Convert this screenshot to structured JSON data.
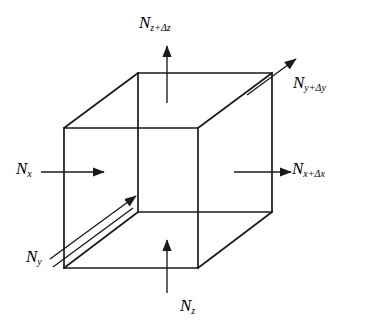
{
  "diagram": {
    "shape": "cube",
    "stroke_color": "#1a1a1a",
    "background_color": "#ffffff",
    "labels": [
      {
        "id": "nz_plus_dz",
        "symbol": "N",
        "subscript": "z+Δz",
        "text": "N_{z+Δz}",
        "position": "top",
        "arrow": "up",
        "description": "flux out of top face"
      },
      {
        "id": "ny_plus_dy",
        "symbol": "N",
        "subscript": "y+Δy",
        "text": "N_{y+Δy}",
        "position": "top-right",
        "arrow": "diagonal-up-right",
        "description": "flux out of back face"
      },
      {
        "id": "nx",
        "symbol": "N",
        "subscript": "x",
        "text": "N_x",
        "position": "left",
        "arrow": "right",
        "description": "flux into left face"
      },
      {
        "id": "nx_plus_dx",
        "symbol": "N",
        "subscript": "x+Δx",
        "text": "N_{x+Δx}",
        "position": "right",
        "arrow": "right",
        "description": "flux out of right face"
      },
      {
        "id": "ny",
        "symbol": "N",
        "subscript": "y",
        "text": "N_y",
        "position": "bottom-left",
        "arrow": "diagonal-up-right-double",
        "description": "flux into front face"
      },
      {
        "id": "nz",
        "symbol": "N",
        "subscript": "z",
        "text": "N_z",
        "position": "bottom",
        "arrow": "up",
        "description": "flux into bottom face"
      }
    ],
    "cube_vertices": {
      "front_top_left": [
        64,
        128
      ],
      "front_top_right": [
        198,
        128
      ],
      "front_bottom_right": [
        198,
        268
      ],
      "front_bottom_left": [
        64,
        268
      ],
      "back_top_left": [
        138,
        73
      ],
      "back_top_right": [
        272,
        73
      ],
      "back_bottom_right": [
        272,
        212
      ],
      "back_bottom_left": [
        138,
        212
      ]
    }
  }
}
